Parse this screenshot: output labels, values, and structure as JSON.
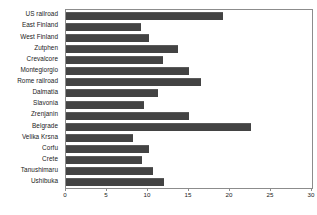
{
  "chart_data": {
    "type": "bar",
    "orientation": "horizontal",
    "title": "",
    "xlabel": "",
    "ylabel": "",
    "xlim": [
      0,
      30
    ],
    "xticks": [
      0,
      5,
      10,
      15,
      20,
      25,
      30
    ],
    "grid": false,
    "legend": null,
    "bar_color": "#434343",
    "frame_color": "#8c8c8c",
    "categories": [
      "US railroad",
      "East Finland",
      "West Finland",
      "Zutphen",
      "Crevalcore",
      "Montegiorgio",
      "Rome railroad",
      "Dalmatia",
      "Slavonia",
      "Zrenjanin",
      "Belgrade",
      "Velika Krsna",
      "Corfu",
      "Crete",
      "Tanushimaru",
      "Ushibuka"
    ],
    "values": [
      19.2,
      9.1,
      10.1,
      13.7,
      11.8,
      15.0,
      16.5,
      11.2,
      9.5,
      15.0,
      22.6,
      8.2,
      10.1,
      9.3,
      10.6,
      12.0
    ]
  }
}
